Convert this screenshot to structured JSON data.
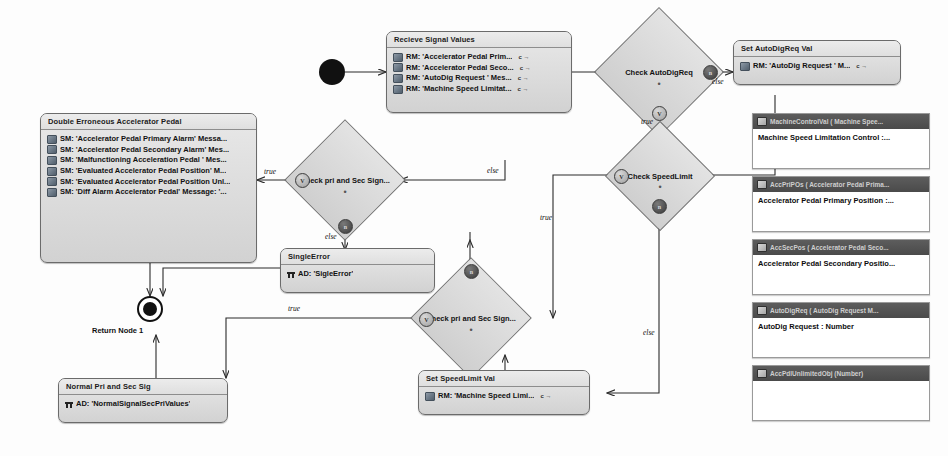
{
  "nodes": {
    "recieve_signal_values": {
      "header": "Recieve Signal Values",
      "rows": [
        "RM: 'Accelerator Pedal Prim...",
        "RM: 'Accelerator Pedal Seco...",
        "RM: 'AutoDig Request ' Mes...",
        "RM: 'Machine Speed Limitat..."
      ],
      "suffix": "c →"
    },
    "double_erroneous": {
      "header": "Double Erroneous Accelerator Pedal",
      "rows": [
        "SM: 'Accelerator Pedal Primary Alarm' Messa...",
        "SM: 'Accelerator Pedal Secondary Alarm' Mes...",
        "SM: 'Malfunctioning Acceleration Pedal ' Mes...",
        "SM: 'Evaluated Accelerator Pedal Position' M...",
        "SM: 'Evaluated Accelerator Pedal Position Unl...",
        "SM: 'Diff Alarm Accelerator Pedal' Message: '..."
      ]
    },
    "single_error": {
      "header": "SingleError",
      "rows": [
        "AD: 'SigleError'"
      ]
    },
    "normal_pri_sec": {
      "header": "Normal Pri and Sec Sig",
      "rows": [
        "AD: 'NormalSignalSecPriValues'"
      ]
    },
    "set_autodigreq_val": {
      "header": "Set AutoDigReq Val",
      "rows": [
        "RM: 'AutoDig Request ' M..."
      ],
      "suffix": "c →"
    },
    "set_speedlimit_val": {
      "header": "Set SpeedLimit Val",
      "rows": [
        "RM: 'Machine Speed Limi..."
      ],
      "suffix": "c →"
    },
    "return_node": {
      "label": "Return Node 1"
    }
  },
  "decisions": [
    {
      "id": "check_autodigreq",
      "label": "Check AutoDigReq"
    },
    {
      "id": "check_speedlimit",
      "label": "Check SpeedLimit"
    },
    {
      "id": "check_pri_sec_upper",
      "label": "Check pri and Sec Sign..."
    },
    {
      "id": "check_pri_sec_lower",
      "label": "Check pri and Sec Sign..."
    }
  ],
  "pins": {
    "v": "V",
    "n": "n"
  },
  "objects": [
    {
      "header": "MachineControlVal ( Machine Spee...",
      "body": "Machine Speed Limitation Control :..."
    },
    {
      "header": "AccPriPOs ( Accelerator Pedal Prima...",
      "body": "Accelerator Pedal Primary Position :..."
    },
    {
      "header": "AccSecPos ( Accelerator Pedal Seco...",
      "body": "Accelerator Pedal Secondary Positio..."
    },
    {
      "header": "AutoDigReq ( AutoDig Request  M...",
      "body": "AutoDig Request : Number"
    },
    {
      "header": "AccPdlUnlimitedObj (Number)",
      "body": ""
    }
  ],
  "edge_labels": {
    "else_autodig": "else",
    "true_autodig": "true",
    "else_speedlimit": "else",
    "true_speedlimit": "true",
    "true_upper": "true",
    "else_upper": "else",
    "else_upper_right": "else",
    "true_lower": "true"
  }
}
